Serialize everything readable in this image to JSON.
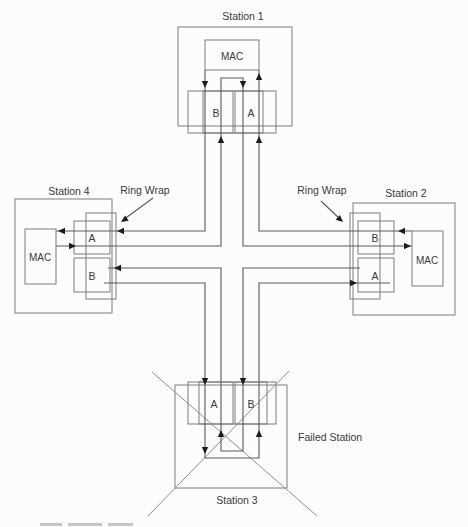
{
  "diagram": {
    "stations": {
      "station1": {
        "label": "Station 1",
        "mac": "MAC",
        "left_port": "B",
        "right_port": "A"
      },
      "station2": {
        "label": "Station 2",
        "mac": "MAC",
        "top_port": "B",
        "bottom_port": "A"
      },
      "station3": {
        "label": "Station 3",
        "left_port": "A",
        "right_port": "B"
      },
      "station4": {
        "label": "Station 4",
        "mac": "MAC",
        "top_port": "A",
        "bottom_port": "B"
      }
    },
    "annotations": {
      "ring_wrap_left": "Ring Wrap",
      "ring_wrap_right": "Ring Wrap",
      "failed_station": "Failed Station"
    },
    "colors": {
      "wire": "#5a5a5a",
      "box_outline": "#7d7d7d",
      "arrowhead": "#1c1c1c",
      "text": "#3a3a3a",
      "background": "#fcfcfc"
    }
  }
}
